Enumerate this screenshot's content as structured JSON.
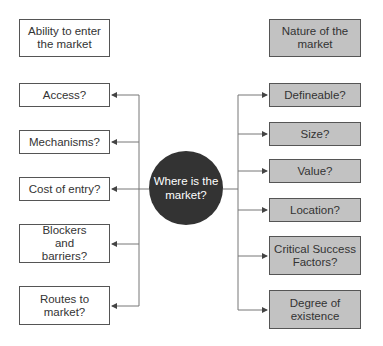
{
  "center": {
    "label": "Where is the market?"
  },
  "left": {
    "header": "Ability to enter the market",
    "items": [
      "Access?",
      "Mechanisms?",
      "Cost of entry?",
      "Blockers and barriers?",
      "Routes to market?"
    ]
  },
  "right": {
    "header": "Nature of the market",
    "items": [
      "Defineable?",
      "Size?",
      "Value?",
      "Location?",
      "Critical Success Factors?",
      "Degree of existence"
    ]
  },
  "colors": {
    "left_box_fill": "#ffffff",
    "right_box_fill": "#c2c2c2",
    "circle_fill": "#333333",
    "line": "#666666"
  }
}
